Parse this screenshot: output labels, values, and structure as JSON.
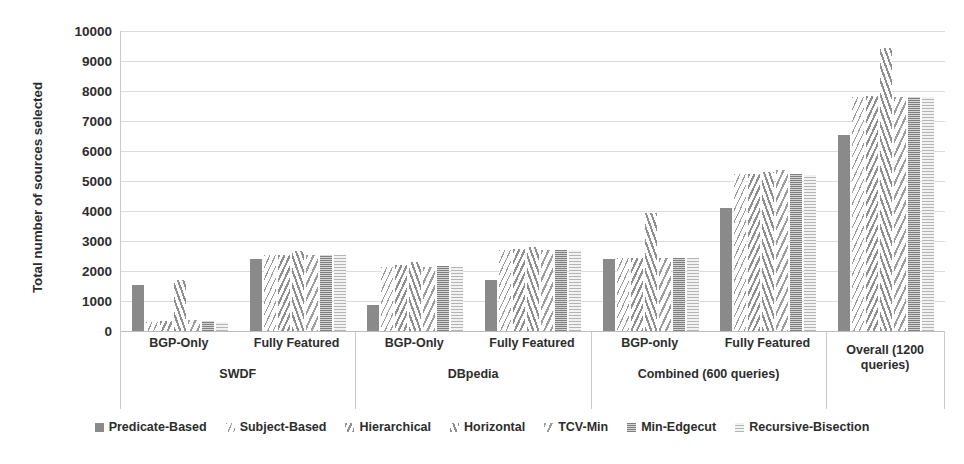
{
  "chart_data": {
    "type": "bar",
    "title": "",
    "xlabel": "",
    "ylabel": "Total number of sources selected",
    "ylim": [
      0,
      10000
    ],
    "ytick_step": 1000,
    "yticks": [
      "10000",
      "9000",
      "8000",
      "7000",
      "6000",
      "5000",
      "4000",
      "3000",
      "2000",
      "1000",
      "0"
    ],
    "grid": true,
    "legend_position": "bottom",
    "categories": [
      "SWDF / BGP-Only",
      "SWDF / Fully Featured",
      "DBpedia / BGP-Only",
      "DBpedia / Fully Featured",
      "Combined (600 queries) / BGP-only",
      "Combined (600 queries) / Fully Featured",
      "Overall (1200 queries)"
    ],
    "series": [
      {
        "name": "Predicate-Based",
        "color": "#8a8a8a",
        "pattern": "solid",
        "values": [
          1550,
          2400,
          880,
          1700,
          2400,
          4100,
          6550
        ]
      },
      {
        "name": "Subject-Based",
        "color": "#9a9a9a",
        "pattern": "light-diagonal",
        "values": [
          300,
          2520,
          2130,
          2700,
          2420,
          5220,
          7800
        ]
      },
      {
        "name": "Hierarchical",
        "color": "#8f8f8f",
        "pattern": "diagonal",
        "values": [
          340,
          2530,
          2200,
          2750,
          2430,
          5250,
          7820
        ]
      },
      {
        "name": "Horizontal",
        "color": "#8f8f8f",
        "pattern": "reverse-diagonal",
        "values": [
          1700,
          2660,
          2300,
          2800,
          3950,
          5300,
          9450
        ]
      },
      {
        "name": "TCV-Min",
        "color": "#9d9d9d",
        "pattern": "wide-diagonal",
        "values": [
          360,
          2520,
          2150,
          2700,
          2430,
          5370,
          7790
        ]
      },
      {
        "name": "Min-Edgecut",
        "color": "#7e7e7e",
        "pattern": "horizontal-lines",
        "values": [
          330,
          2540,
          2180,
          2700,
          2430,
          5230,
          7800
        ]
      },
      {
        "name": "Recursive-Bisection",
        "color": "#b4b4b4",
        "pattern": "fine-lines",
        "values": [
          300,
          2520,
          2150,
          2700,
          2420,
          5210,
          7800
        ]
      }
    ]
  },
  "axis": {
    "y_title": "Total number of sources selected",
    "groups": [
      {
        "label": "SWDF",
        "sublabels": [
          "BGP-Only",
          "Fully Featured"
        ]
      },
      {
        "label": "DBpedia",
        "sublabels": [
          "BGP-Only",
          "Fully Featured"
        ]
      },
      {
        "label": "Combined (600 queries)",
        "sublabels": [
          "BGP-only",
          "Fully Featured"
        ]
      },
      {
        "label": "Overall (1200 queries)",
        "sublabels": [
          ""
        ]
      }
    ]
  },
  "legend": {
    "items": [
      {
        "label": "Predicate-Based"
      },
      {
        "label": "Subject-Based"
      },
      {
        "label": "Hierarchical"
      },
      {
        "label": "Horizontal"
      },
      {
        "label": "TCV-Min"
      },
      {
        "label": "Min-Edgecut"
      },
      {
        "label": "Recursive-Bisection"
      }
    ]
  }
}
